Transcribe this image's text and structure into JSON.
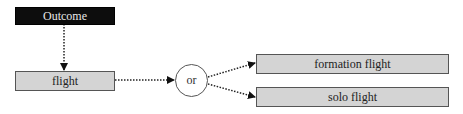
{
  "diagram": {
    "type": "flowchart",
    "nodes": {
      "outcome": {
        "label": "Outcome",
        "style": "dark",
        "fill": "#0d0d0d",
        "text_color": "#e8e8e8"
      },
      "flight": {
        "label": "flight",
        "style": "light",
        "fill": "#d4d4d4"
      },
      "or": {
        "label": "or",
        "shape": "circle"
      },
      "formation_flight": {
        "label": "formation flight",
        "style": "light",
        "fill": "#d4d4d4"
      },
      "solo_flight": {
        "label": "solo flight",
        "style": "light",
        "fill": "#d4d4d4"
      }
    },
    "edges": [
      {
        "from": "Outcome",
        "to": "flight",
        "style": "dotted",
        "arrow": "filled"
      },
      {
        "from": "flight",
        "to": "or",
        "style": "dotted",
        "arrow": "filled"
      },
      {
        "from": "or",
        "to": "formation flight",
        "style": "dotted",
        "arrow": "filled"
      },
      {
        "from": "or",
        "to": "solo flight",
        "style": "dotted",
        "arrow": "filled"
      }
    ]
  }
}
